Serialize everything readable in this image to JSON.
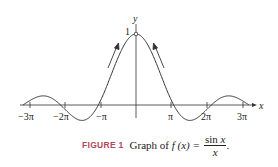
{
  "chart_data": {
    "type": "line",
    "function": "sin(x)/x",
    "xlabel": "x",
    "ylabel": "y",
    "x_ticks": [
      "-3π",
      "-2π",
      "-π",
      "π",
      "2π",
      "3π"
    ],
    "x_tick_values": [
      -9.4248,
      -6.2832,
      -3.1416,
      3.1416,
      6.2832,
      9.4248
    ],
    "y_ticks": [
      "1"
    ],
    "y_tick_values": [
      1
    ],
    "xlim": [
      -9.4248,
      9.4248
    ],
    "ylim": [
      -0.25,
      1.05
    ],
    "open_point": {
      "x": 0,
      "y": 1
    },
    "annotations": [
      "arrow approaching (0,1) from left",
      "arrow approaching (0,1) from right"
    ],
    "grid": false,
    "legend": null
  },
  "caption": {
    "label": "FIGURE 1",
    "text": "Graph of",
    "fx": "f (x) =",
    "numerator_fn": "sin ",
    "numerator_var": "x",
    "denominator": "x",
    "trailing": "."
  },
  "axes": {
    "x_label": "x",
    "y_label": "y",
    "y_one": "1"
  },
  "ticks": {
    "m3pi": "−3π",
    "m2pi": "−2π",
    "mpi": "−π",
    "pi": "π",
    "p2pi": "2π",
    "p3pi": "3π"
  }
}
